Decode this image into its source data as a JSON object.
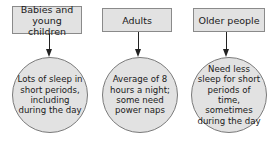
{
  "diagram": {
    "type": "flow",
    "columns": [
      {
        "label": "Babies and young children",
        "description": "Lots of sleep in short periods, including during the day"
      },
      {
        "label": "Adults",
        "description": "Average of 8 hours a night; some need power naps"
      },
      {
        "label": "Older people",
        "description": "Need less sleep for short periods of time, sometimes during the day"
      }
    ],
    "colors": {
      "box_fill": "#e2e2e2",
      "border": "#8a8a8a",
      "arrow": "#222222",
      "text": "#1a1a1a"
    }
  }
}
